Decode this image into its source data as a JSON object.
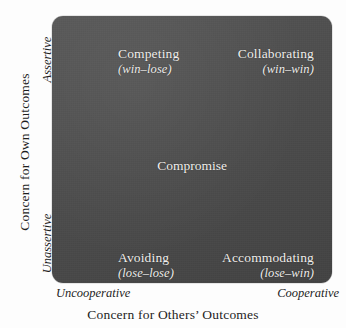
{
  "figure": {
    "type": "conflict-management-styles-matrix",
    "box_color": "#4a4a4a",
    "label_color": "#f2f0ee",
    "axis_text_color": "#1d1d1d"
  },
  "y_axis": {
    "title": "Concern for Own Outcomes",
    "high_label": "Assertive",
    "low_label": "Unassertive"
  },
  "x_axis": {
    "title": "Concern for Others’ Outcomes",
    "low_label": "Uncooperative",
    "high_label": "Cooperative"
  },
  "quadrants": [
    {
      "id": "competing",
      "name": "Competing",
      "outcome": "(win–lose)",
      "position": "top-left"
    },
    {
      "id": "collaborating",
      "name": "Collaborating",
      "outcome": "(win–win)",
      "position": "top-right"
    },
    {
      "id": "avoiding",
      "name": "Avoiding",
      "outcome": "(lose–lose)",
      "position": "bottom-left"
    },
    {
      "id": "accommodating",
      "name": "Accommodating",
      "outcome": "(lose–win)",
      "position": "bottom-right"
    }
  ],
  "center": {
    "name": "Compromise"
  },
  "chart_data": {
    "type": "scatter",
    "title": "",
    "xlabel": "Concern for Others’ Outcomes",
    "ylabel": "Concern for Own Outcomes",
    "xlim": [
      0,
      1
    ],
    "ylim": [
      0,
      1
    ],
    "xticklabels": [
      "Uncooperative",
      "Cooperative"
    ],
    "yticklabels": [
      "Unassertive",
      "Assertive"
    ],
    "grid": false,
    "legend": "none",
    "annotations": [
      {
        "label": "Competing",
        "sublabel": "(win–lose)",
        "x": 0.1,
        "y": 0.92
      },
      {
        "label": "Collaborating",
        "sublabel": "(win–win)",
        "x": 0.9,
        "y": 0.92
      },
      {
        "label": "Compromise",
        "sublabel": "",
        "x": 0.5,
        "y": 0.5
      },
      {
        "label": "Avoiding",
        "sublabel": "(lose–lose)",
        "x": 0.1,
        "y": 0.08
      },
      {
        "label": "Accommodating",
        "sublabel": "(lose–win)",
        "x": 0.9,
        "y": 0.08
      }
    ]
  }
}
